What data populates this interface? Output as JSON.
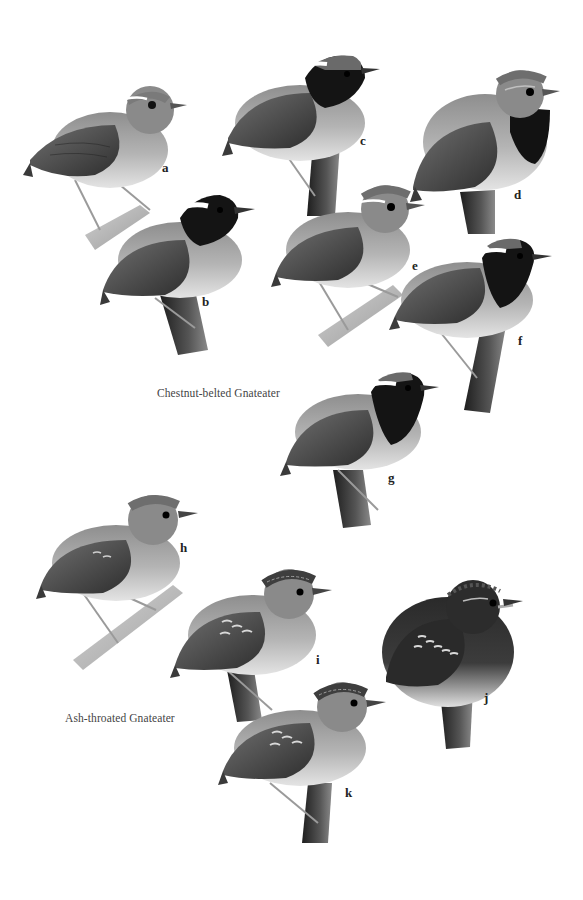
{
  "plate": {
    "background": "#ffffff",
    "captions": {
      "chestnut_belted": "Chestnut-belted Gnateater",
      "ash_throated": "Ash-throated Gnateater"
    },
    "figures": [
      {
        "id": "a",
        "label": "a",
        "species": "Chestnut-belted Gnateater",
        "features": [
          "white-supercilium",
          "no-black-face"
        ]
      },
      {
        "id": "b",
        "label": "b",
        "species": "Chestnut-belted Gnateater",
        "features": [
          "black-face",
          "white-postocular"
        ]
      },
      {
        "id": "c",
        "label": "c",
        "species": "Chestnut-belted Gnateater",
        "features": [
          "black-face",
          "white-postocular"
        ]
      },
      {
        "id": "d",
        "label": "d",
        "species": "Chestnut-belted Gnateater",
        "features": [
          "black-throat"
        ]
      },
      {
        "id": "e",
        "label": "e",
        "species": "Chestnut-belted Gnateater",
        "features": [
          "white-supercilium"
        ]
      },
      {
        "id": "f",
        "label": "f",
        "species": "Chestnut-belted Gnateater",
        "features": [
          "black-face",
          "white-postocular"
        ]
      },
      {
        "id": "g",
        "label": "g",
        "species": "Chestnut-belted Gnateater",
        "features": [
          "black-face",
          "white-postocular"
        ]
      },
      {
        "id": "h",
        "label": "h",
        "species": "Ash-throated Gnateater",
        "features": [
          "plain-head"
        ]
      },
      {
        "id": "i",
        "label": "i",
        "species": "Ash-throated Gnateater",
        "features": [
          "streaked-crown",
          "spotted-coverts"
        ]
      },
      {
        "id": "j",
        "label": "j",
        "species": "Ash-throated Gnateater",
        "features": [
          "dark-scaled",
          "spotted-coverts"
        ]
      },
      {
        "id": "k",
        "label": "k",
        "species": "Ash-throated Gnateater",
        "features": [
          "streaked-crown",
          "spotted-coverts"
        ]
      }
    ],
    "colors": {
      "wing": "#4a4a4a",
      "back": "#6b6b6b",
      "breast": "#9c9c9c",
      "belly": "#d8d8d8",
      "black_mask": "#141414",
      "branch": "#3a3a3a",
      "branch_light": "#a8a8a8"
    }
  }
}
